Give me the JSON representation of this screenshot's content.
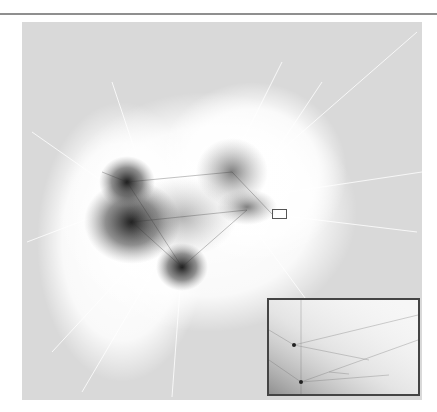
{
  "figure": {
    "background_color": "#d9d9d9",
    "edge_color": "#ffffff",
    "cluster_color": "#222222",
    "inset_border_color": "#444444",
    "selection_box_color": "#555555"
  }
}
